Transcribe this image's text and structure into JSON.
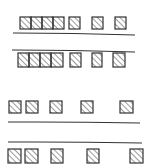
{
  "diagram": {
    "title": "",
    "stroke": "#333333",
    "hatch": "#444444",
    "background": "#ffffff",
    "groups": [
      {
        "name": "top-group",
        "rows": [
          {
            "y": 17,
            "boxes": [
              {
                "x": 20,
                "w": 11
              },
              {
                "x": 31,
                "w": 11
              },
              {
                "x": 42,
                "w": 11
              },
              {
                "x": 53,
                "w": 11
              },
              {
                "x": 69,
                "w": 11
              },
              {
                "x": 92,
                "w": 11
              },
              {
                "x": 115,
                "w": 11
              }
            ],
            "height": 12
          },
          {
            "y": 53,
            "boxes": [
              {
                "x": 18,
                "w": 11
              },
              {
                "x": 29,
                "w": 11
              },
              {
                "x": 40,
                "w": 11
              },
              {
                "x": 51,
                "w": 12
              },
              {
                "x": 70,
                "w": 11
              },
              {
                "x": 92,
                "w": 10
              },
              {
                "x": 113,
                "w": 12
              }
            ],
            "height": 14
          }
        ],
        "lines": [
          {
            "x1": 13,
            "y1": 33,
            "x2": 135,
            "y2": 35
          },
          {
            "x1": 12,
            "y1": 50,
            "x2": 135,
            "y2": 52
          }
        ]
      },
      {
        "name": "bottom-group",
        "rows": [
          {
            "y": 101,
            "boxes": [
              {
                "x": 9,
                "w": 12
              },
              {
                "x": 26,
                "w": 12
              },
              {
                "x": 50,
                "w": 12
              },
              {
                "x": 81,
                "w": 12
              },
              {
                "x": 120,
                "w": 13
              }
            ],
            "height": 12
          },
          {
            "y": 149,
            "boxes": [
              {
                "x": 8,
                "w": 13
              },
              {
                "x": 25,
                "w": 13
              },
              {
                "x": 51,
                "w": 12
              },
              {
                "x": 87,
                "w": 12
              },
              {
                "x": 130,
                "w": 13
              }
            ],
            "height": 14
          }
        ],
        "lines": [
          {
            "x1": 8,
            "y1": 122,
            "x2": 140,
            "y2": 123
          },
          {
            "x1": 8,
            "y1": 142,
            "x2": 142,
            "y2": 143
          }
        ]
      }
    ]
  }
}
